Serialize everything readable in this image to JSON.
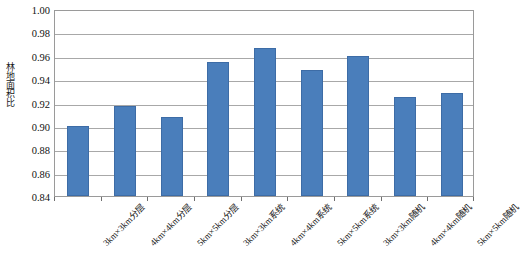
{
  "chart_data": {
    "type": "bar",
    "title": "",
    "xlabel": "",
    "ylabel": "林地面积比",
    "ylim": [
      0.84,
      1.0
    ],
    "ytick_interval": 0.02,
    "ytick_labels": [
      "1.00",
      "0.98",
      "0.96",
      "0.94",
      "0.92",
      "0.90",
      "0.88",
      "0.86",
      "0.84"
    ],
    "ytick_values": [
      1.0,
      0.98,
      0.96,
      0.94,
      0.92,
      0.9,
      0.88,
      0.86,
      0.84
    ],
    "grid": true,
    "legend": false,
    "legend_position": "none",
    "bar_color": "#4a7ebb",
    "bar_border_color": "#3d6ca6",
    "categories": [
      "3km×3km分层",
      "4km×4km分层",
      "5km×5km分层",
      "3km×3km系统",
      "4km×4km系统",
      "5km×5km系统",
      "3km×3km随机",
      "4km×4km随机",
      "5km×5km随机"
    ],
    "values": [
      0.9,
      0.917,
      0.908,
      0.955,
      0.967,
      0.948,
      0.96,
      0.925,
      0.928
    ]
  }
}
